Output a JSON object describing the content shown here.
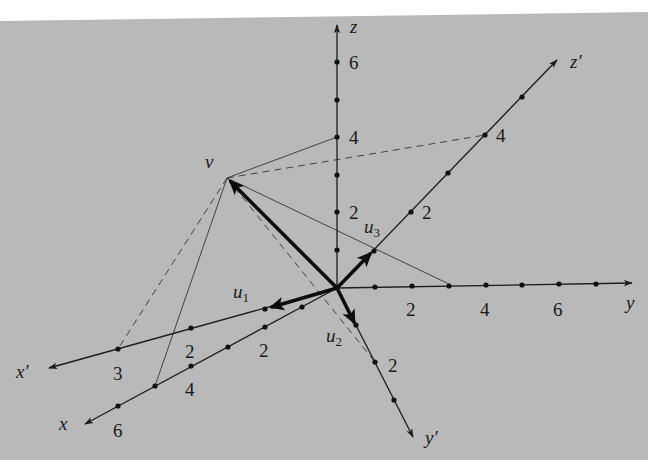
{
  "figure": {
    "colors": {
      "background": "#b9b9b9",
      "page": "#ffffff",
      "ink": "#1c1c1c"
    }
  },
  "axes": {
    "z": {
      "label": "z",
      "ticks": [
        "2",
        "4",
        "6"
      ]
    },
    "y": {
      "label": "y",
      "ticks": [
        "2",
        "4",
        "6"
      ]
    },
    "x": {
      "label": "x",
      "ticks": [
        "2",
        "4",
        "6"
      ]
    },
    "xp": {
      "label": "x′",
      "ticks": [
        "2",
        "3"
      ]
    },
    "yp": {
      "label": "y′",
      "ticks": [
        "2"
      ]
    },
    "zp": {
      "label": "z′",
      "ticks": [
        "2",
        "4"
      ]
    }
  },
  "vectors": {
    "v": {
      "label": "v"
    },
    "u1": {
      "base": "u",
      "sub": "1"
    },
    "u2": {
      "base": "u",
      "sub": "2"
    },
    "u3": {
      "base": "u",
      "sub": "3"
    }
  }
}
